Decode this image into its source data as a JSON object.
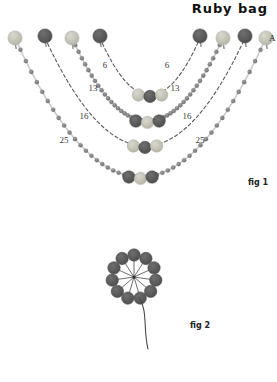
{
  "page": {
    "title": "Ruby bag",
    "background_color": "#ffffff"
  },
  "colors": {
    "bead_light": "#d9d9cf",
    "bead_light_edge": "#b4b4a8",
    "bead_dark": "#6f6f6f",
    "bead_dark_edge": "#4e4e4e",
    "chain_bead": "#8d8d8d",
    "thread": "#4a4a4a",
    "text": "#222222"
  },
  "figures": [
    {
      "id": "fig1",
      "caption": "fig 1",
      "end_label": "A",
      "top_beads": [
        {
          "x": 15,
          "y": 38,
          "color": "light"
        },
        {
          "x": 45,
          "y": 36,
          "color": "dark"
        },
        {
          "x": 72,
          "y": 38,
          "color": "light"
        },
        {
          "x": 100,
          "y": 36,
          "color": "dark"
        },
        {
          "x": 200,
          "y": 36,
          "color": "dark"
        },
        {
          "x": 223,
          "y": 38,
          "color": "light"
        },
        {
          "x": 245,
          "y": 36,
          "color": "dark"
        },
        {
          "x": 266,
          "y": 38,
          "color": "light"
        }
      ],
      "arcs": [
        {
          "name": "thread-arc-6",
          "style": "dashed",
          "count_label": "6",
          "left_anchor": 100,
          "right_anchor": 200,
          "bottom_y": 95,
          "cluster": [
            "light",
            "dark",
            "light"
          ]
        },
        {
          "name": "bead-arc-13",
          "style": "beaded",
          "count_label": "13",
          "left_anchor": 72,
          "right_anchor": 223,
          "bottom_y": 121,
          "cluster": [
            "dark",
            "light",
            "dark"
          ]
        },
        {
          "name": "thread-arc-16",
          "style": "dashed",
          "count_label": "16",
          "left_anchor": 45,
          "right_anchor": 245,
          "bottom_y": 146,
          "cluster": [
            "light",
            "dark",
            "light"
          ]
        },
        {
          "name": "bead-arc-25",
          "style": "beaded",
          "count_label": "25",
          "left_anchor": 15,
          "right_anchor": 266,
          "bottom_y": 177,
          "cluster": [
            "dark",
            "light",
            "dark"
          ]
        }
      ],
      "number_labels": [
        {
          "text": "6",
          "x": 105,
          "y": 68
        },
        {
          "text": "6",
          "x": 167,
          "y": 68
        },
        {
          "text": "13",
          "x": 93,
          "y": 91
        },
        {
          "text": "13",
          "x": 175,
          "y": 91
        },
        {
          "text": "16",
          "x": 84,
          "y": 119
        },
        {
          "text": "16",
          "x": 187,
          "y": 119
        },
        {
          "text": "25",
          "x": 64,
          "y": 143
        },
        {
          "text": "25",
          "x": 200,
          "y": 143
        }
      ]
    },
    {
      "id": "fig2",
      "caption": "fig 2",
      "ring": {
        "center_x": 134,
        "center_y": 277,
        "radius": 22,
        "bead_count": 11,
        "bead_color": "dark",
        "spokes": true
      },
      "tail": {
        "description": "thread tail curving down from rosette"
      }
    }
  ]
}
